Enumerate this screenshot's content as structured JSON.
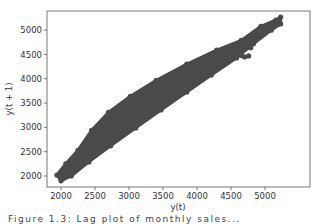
{
  "chart_data": {
    "type": "scatter",
    "title": "",
    "xlabel": "y(t)",
    "ylabel": "y(t + 1)",
    "xlim": [
      1850,
      5400
    ],
    "ylim": [
      1850,
      5400
    ],
    "xticks": [
      2000,
      2500,
      3000,
      3500,
      4000,
      4500,
      5000
    ],
    "yticks": [
      2000,
      2500,
      3000,
      3500,
      4000,
      4500,
      5000
    ],
    "grid": false,
    "legend": null,
    "marker_color": "#4a4a4a",
    "series": [
      {
        "name": "lag-1",
        "band_upper": [
          [
            1940,
            2020
          ],
          [
            2070,
            2250
          ],
          [
            2250,
            2530
          ],
          [
            2450,
            2940
          ],
          [
            2700,
            3310
          ],
          [
            3020,
            3640
          ],
          [
            3400,
            3970
          ],
          [
            3850,
            4300
          ],
          [
            4290,
            4590
          ],
          [
            4650,
            4790
          ],
          [
            4940,
            5080
          ],
          [
            5160,
            5210
          ],
          [
            5230,
            5270
          ]
        ],
        "band_lower": [
          [
            5230,
            5130
          ],
          [
            5090,
            5000
          ],
          [
            4830,
            4720
          ],
          [
            4580,
            4430
          ],
          [
            4210,
            4080
          ],
          [
            3850,
            3730
          ],
          [
            3470,
            3360
          ],
          [
            3100,
            2990
          ],
          [
            2730,
            2620
          ],
          [
            2410,
            2290
          ],
          [
            2150,
            2000
          ],
          [
            2000,
            1900
          ]
        ],
        "outliers": [
          [
            4700,
            4450
          ],
          [
            4760,
            4470
          ],
          [
            4790,
            4640
          ],
          [
            4650,
            4480
          ],
          [
            4300,
            4380
          ]
        ]
      }
    ]
  },
  "caption": "Figure 1.3: Lag plot of monthly sales..."
}
